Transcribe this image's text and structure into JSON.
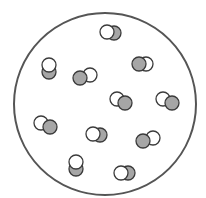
{
  "diagram": {
    "colors": {
      "background": "#ffffff",
      "container_stroke": "#555555",
      "atom_stroke": "#3a3a3a",
      "white_atom_fill": "#ffffff",
      "gray_atom_fill": "#a6a6a6"
    },
    "container": {
      "cx": 105,
      "cy": 104,
      "r": 91,
      "stroke_width": 2
    },
    "atom_radius": 7,
    "molecules": [
      {
        "white": [
          107,
          32
        ],
        "gray": [
          114,
          33
        ],
        "front": "white"
      },
      {
        "white": [
          49,
          65
        ],
        "gray": [
          49,
          72
        ],
        "front": "white"
      },
      {
        "white": [
          90,
          75
        ],
        "gray": [
          80,
          78
        ],
        "front": "gray"
      },
      {
        "white": [
          146,
          64
        ],
        "gray": [
          139,
          64
        ],
        "front": "gray"
      },
      {
        "white": [
          117,
          99
        ],
        "gray": [
          125,
          103
        ],
        "front": "gray"
      },
      {
        "white": [
          163,
          99
        ],
        "gray": [
          172,
          103
        ],
        "front": "gray"
      },
      {
        "white": [
          41,
          123
        ],
        "gray": [
          50,
          127
        ],
        "front": "gray"
      },
      {
        "white": [
          93,
          134
        ],
        "gray": [
          100,
          135
        ],
        "front": "white"
      },
      {
        "white": [
          153,
          138
        ],
        "gray": [
          143,
          141
        ],
        "front": "gray"
      },
      {
        "white": [
          76,
          162
        ],
        "gray": [
          76,
          169
        ],
        "front": "white"
      },
      {
        "white": [
          121,
          173
        ],
        "gray": [
          128,
          173
        ],
        "front": "white"
      }
    ]
  }
}
